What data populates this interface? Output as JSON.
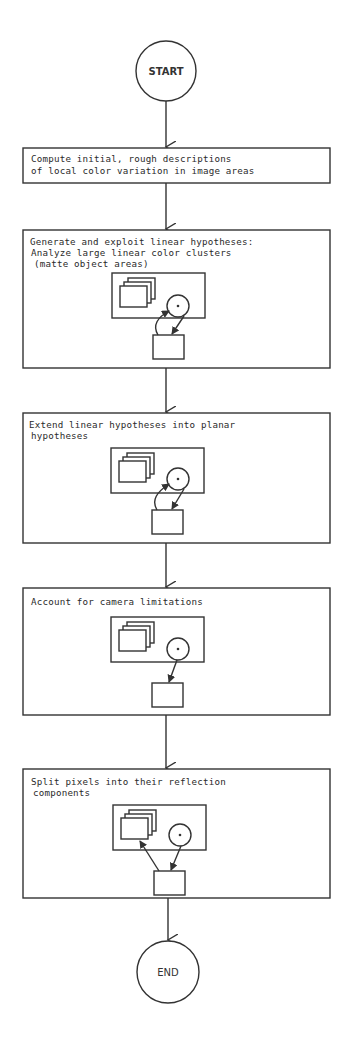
{
  "diagram": {
    "type": "flowchart",
    "start": {
      "label": "START"
    },
    "end": {
      "label": "END"
    },
    "steps": [
      {
        "id": "step-1",
        "lines": [
          "Compute initial, rough descriptions",
          "of local color variation in image areas"
        ],
        "has_icon": false
      },
      {
        "id": "step-2",
        "lines": [
          "Generate and exploit linear hypotheses:",
          "Analyze large linear color clusters",
          "(matte object areas)"
        ],
        "has_icon": true,
        "icon_arrows": [
          "box-to-circle",
          "circle-to-box"
        ]
      },
      {
        "id": "step-3",
        "lines": [
          "Extend linear hypotheses into planar",
          "hypotheses"
        ],
        "has_icon": true,
        "icon_arrows": [
          "box-to-circle",
          "circle-to-box"
        ]
      },
      {
        "id": "step-4",
        "lines": [
          "Account for camera limitations"
        ],
        "has_icon": true,
        "icon_arrows": [
          "circle-to-box"
        ]
      },
      {
        "id": "step-5",
        "lines": [
          "Split pixels into their reflection",
          "components"
        ],
        "has_icon": true,
        "icon_arrows": [
          "circle-to-box",
          "box-to-stack"
        ]
      }
    ],
    "colors": {
      "line": "#333333",
      "background": "#ffffff",
      "text": "#2a2a2a"
    }
  }
}
